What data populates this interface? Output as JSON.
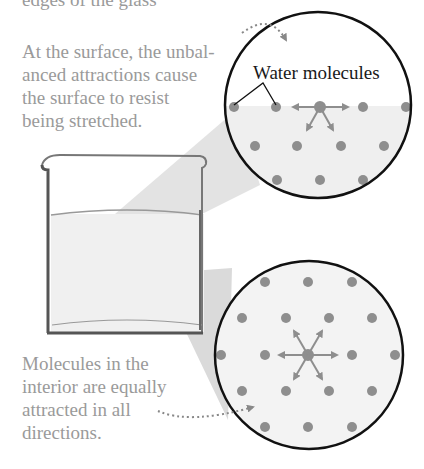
{
  "header": {
    "cut_off_text": "edges of the glass"
  },
  "captions": {
    "surface": "At the surface, the unbal-\nanced attractions cause\nthe surface to resist\nbeing stretched.",
    "interior": "Molecules in the\ninterior are equally\nattracted in all\ndirections."
  },
  "labels": {
    "water_molecules": "Water molecules"
  },
  "colors": {
    "molecule": "#8e8e8e",
    "liquid": "#efefef",
    "beam": "#dcdcdc",
    "outline": "#111111",
    "caption_text": "#9a9a9a"
  }
}
